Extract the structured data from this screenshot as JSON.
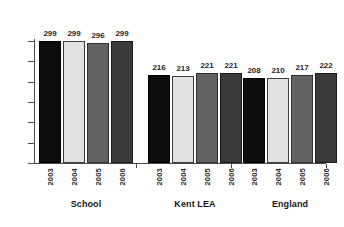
{
  "chart_data": {
    "type": "bar",
    "title": "",
    "xlabel": "",
    "ylabel": "",
    "ylim": [
      0,
      300
    ],
    "yticks": [
      0,
      50,
      100,
      150,
      200,
      250,
      300
    ],
    "grid": false,
    "legend": "none",
    "categories": [
      "School",
      "Kent LEA",
      "England"
    ],
    "series": [
      {
        "name": "2003",
        "color": "#0d0d0d",
        "values": [
          299,
          216,
          208
        ]
      },
      {
        "name": "2004",
        "color": "#e2e2e2",
        "values": [
          299,
          213,
          210
        ]
      },
      {
        "name": "2005",
        "color": "#636363",
        "values": [
          296,
          221,
          217
        ]
      },
      {
        "name": "2006",
        "color": "#3a3a3a",
        "values": [
          299,
          221,
          222
        ]
      }
    ],
    "groups": [
      {
        "label": "School",
        "bars": [
          {
            "year": "2003",
            "value": 299,
            "color": "#0d0d0d"
          },
          {
            "year": "2004",
            "value": 299,
            "color": "#e2e2e2"
          },
          {
            "year": "2005",
            "value": 296,
            "color": "#636363"
          },
          {
            "year": "2006",
            "value": 299,
            "color": "#3a3a3a"
          }
        ]
      },
      {
        "label": "Kent LEA",
        "bars": [
          {
            "year": "2003",
            "value": 216,
            "color": "#0d0d0d"
          },
          {
            "year": "2004",
            "value": 213,
            "color": "#e2e2e2"
          },
          {
            "year": "2005",
            "value": 221,
            "color": "#636363"
          },
          {
            "year": "2006",
            "value": 221,
            "color": "#3a3a3a"
          }
        ]
      },
      {
        "label": "England",
        "bars": [
          {
            "year": "2003",
            "value": 208,
            "color": "#0d0d0d"
          },
          {
            "year": "2004",
            "value": 210,
            "color": "#e2e2e2"
          },
          {
            "year": "2005",
            "value": 217,
            "color": "#636363"
          },
          {
            "year": "2006",
            "value": 222,
            "color": "#3a3a3a"
          }
        ]
      }
    ]
  }
}
